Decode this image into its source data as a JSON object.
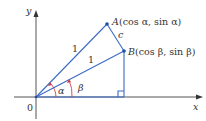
{
  "diagram": {
    "axes": {
      "x_label": "x",
      "y_label": "y",
      "origin_label": "0"
    },
    "points": {
      "A": {
        "label": "A",
        "coords_text": "(cos α, sin α)"
      },
      "B": {
        "label": "B",
        "coords_text": "(cos β, sin β)"
      }
    },
    "segments": {
      "OA_label": "1",
      "OB_label": "1",
      "AB_label": "c"
    },
    "angles": {
      "alpha": "α",
      "beta": "β"
    },
    "colors": {
      "axis": "#555555",
      "line": "#3a6bc4",
      "angle_arc": "#d0404a",
      "text": "#333333"
    }
  }
}
